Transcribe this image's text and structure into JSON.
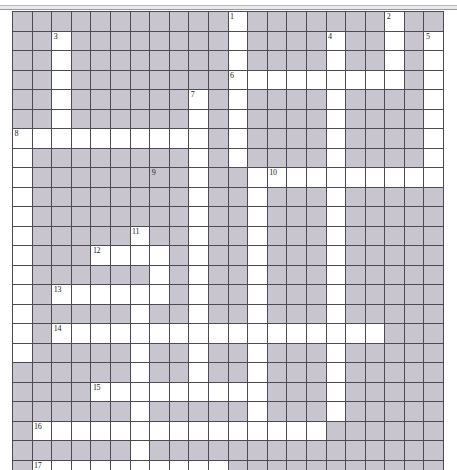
{
  "page": {
    "type": "crossword-grid",
    "background_color": "#ffffff",
    "rule_color": "#9a9aa0"
  },
  "grid": {
    "columns": 22,
    "rows": 23,
    "cell_size_px": 19.5,
    "origin_x_px": 12,
    "origin_y_px": 11,
    "block_color": "#c9c5cf",
    "open_color": "#ffffff",
    "line_color": "#4c4a52",
    "legend": {
      "1": "blocked / shaded cell",
      "0": "open / white answer cell"
    },
    "cells": [
      [
        1,
        1,
        1,
        1,
        1,
        1,
        1,
        1,
        1,
        1,
        1,
        0,
        1,
        1,
        1,
        1,
        1,
        1,
        1,
        0,
        1,
        1
      ],
      [
        1,
        1,
        0,
        1,
        1,
        1,
        1,
        1,
        1,
        1,
        1,
        0,
        1,
        1,
        1,
        1,
        0,
        1,
        1,
        0,
        1,
        0
      ],
      [
        1,
        1,
        0,
        1,
        1,
        1,
        1,
        1,
        1,
        1,
        1,
        0,
        1,
        1,
        1,
        1,
        0,
        1,
        1,
        0,
        1,
        0
      ],
      [
        1,
        1,
        0,
        1,
        1,
        1,
        1,
        1,
        1,
        1,
        1,
        0,
        0,
        0,
        0,
        0,
        0,
        0,
        0,
        0,
        1,
        0
      ],
      [
        1,
        1,
        0,
        1,
        1,
        1,
        1,
        1,
        1,
        0,
        1,
        0,
        1,
        1,
        1,
        1,
        0,
        1,
        1,
        1,
        1,
        0
      ],
      [
        1,
        1,
        0,
        1,
        1,
        1,
        1,
        1,
        1,
        0,
        1,
        0,
        1,
        1,
        1,
        1,
        0,
        1,
        1,
        1,
        1,
        0
      ],
      [
        0,
        0,
        0,
        0,
        0,
        0,
        0,
        0,
        0,
        0,
        1,
        0,
        1,
        1,
        1,
        1,
        0,
        1,
        1,
        1,
        1,
        0
      ],
      [
        0,
        1,
        1,
        1,
        1,
        1,
        1,
        1,
        1,
        0,
        1,
        0,
        1,
        1,
        1,
        1,
        0,
        1,
        1,
        1,
        1,
        0
      ],
      [
        0,
        1,
        1,
        1,
        1,
        1,
        1,
        1,
        1,
        0,
        1,
        1,
        0,
        0,
        0,
        0,
        0,
        0,
        0,
        0,
        0,
        0
      ],
      [
        0,
        1,
        1,
        1,
        1,
        1,
        1,
        1,
        1,
        0,
        1,
        1,
        0,
        1,
        1,
        1,
        0,
        1,
        1,
        1,
        1,
        1
      ],
      [
        0,
        1,
        1,
        1,
        1,
        1,
        1,
        1,
        1,
        0,
        1,
        1,
        0,
        1,
        1,
        1,
        0,
        1,
        1,
        1,
        1,
        1
      ],
      [
        0,
        1,
        1,
        1,
        1,
        1,
        0,
        1,
        1,
        0,
        1,
        1,
        0,
        1,
        1,
        1,
        0,
        1,
        1,
        1,
        1,
        1
      ],
      [
        0,
        1,
        1,
        1,
        0,
        0,
        0,
        0,
        1,
        0,
        1,
        1,
        0,
        1,
        1,
        1,
        0,
        1,
        1,
        1,
        1,
        1
      ],
      [
        0,
        1,
        1,
        1,
        1,
        1,
        1,
        0,
        1,
        0,
        1,
        1,
        0,
        1,
        1,
        1,
        0,
        1,
        1,
        1,
        1,
        1
      ],
      [
        0,
        1,
        0,
        0,
        0,
        0,
        0,
        0,
        1,
        0,
        1,
        1,
        0,
        1,
        1,
        1,
        0,
        1,
        1,
        1,
        1,
        1
      ],
      [
        0,
        1,
        1,
        1,
        1,
        1,
        0,
        1,
        1,
        0,
        1,
        1,
        0,
        1,
        1,
        1,
        0,
        1,
        1,
        1,
        1,
        1
      ],
      [
        0,
        1,
        0,
        0,
        0,
        0,
        0,
        0,
        0,
        0,
        0,
        0,
        0,
        0,
        0,
        0,
        0,
        0,
        0,
        1,
        1,
        1
      ],
      [
        0,
        1,
        1,
        1,
        1,
        1,
        0,
        1,
        1,
        0,
        1,
        1,
        0,
        1,
        1,
        1,
        0,
        1,
        1,
        1,
        1,
        1
      ],
      [
        1,
        1,
        1,
        1,
        1,
        1,
        0,
        1,
        1,
        0,
        1,
        1,
        0,
        1,
        1,
        1,
        0,
        1,
        1,
        1,
        1,
        1
      ],
      [
        1,
        1,
        1,
        1,
        0,
        0,
        0,
        0,
        0,
        0,
        0,
        0,
        0,
        1,
        1,
        1,
        0,
        1,
        1,
        1,
        1,
        1
      ],
      [
        1,
        1,
        1,
        1,
        1,
        1,
        0,
        1,
        1,
        1,
        1,
        1,
        0,
        1,
        1,
        1,
        0,
        1,
        1,
        1,
        1,
        1
      ],
      [
        1,
        0,
        0,
        0,
        0,
        0,
        0,
        0,
        0,
        0,
        0,
        0,
        0,
        0,
        0,
        0,
        1,
        1,
        1,
        1,
        1,
        1
      ],
      [
        1,
        1,
        1,
        1,
        1,
        1,
        0,
        1,
        1,
        1,
        1,
        1,
        1,
        1,
        1,
        1,
        1,
        1,
        1,
        1,
        1,
        1
      ]
    ],
    "extra_rows": [
      [
        1,
        0,
        0,
        0,
        0,
        0,
        0,
        0,
        0,
        0,
        0,
        1,
        1,
        1,
        1,
        1,
        1,
        1,
        1,
        1,
        1,
        1
      ]
    ],
    "numbers": [
      {
        "n": "1",
        "row": 0,
        "col": 11
      },
      {
        "n": "2",
        "row": 0,
        "col": 19
      },
      {
        "n": "3",
        "row": 1,
        "col": 2
      },
      {
        "n": "4",
        "row": 1,
        "col": 16
      },
      {
        "n": "5",
        "row": 1,
        "col": 21
      },
      {
        "n": "6",
        "row": 3,
        "col": 11
      },
      {
        "n": "7",
        "row": 4,
        "col": 9
      },
      {
        "n": "8",
        "row": 6,
        "col": 0
      },
      {
        "n": "9",
        "row": 8,
        "col": 7
      },
      {
        "n": "10",
        "row": 8,
        "col": 13
      },
      {
        "n": "11",
        "row": 11,
        "col": 6
      },
      {
        "n": "12",
        "row": 12,
        "col": 4
      },
      {
        "n": "13",
        "row": 14,
        "col": 2
      },
      {
        "n": "14",
        "row": 16,
        "col": 2
      },
      {
        "n": "15",
        "row": 19,
        "col": 4
      },
      {
        "n": "16",
        "row": 21,
        "col": 1
      },
      {
        "n": "17",
        "row": 23,
        "col": 1
      }
    ]
  }
}
